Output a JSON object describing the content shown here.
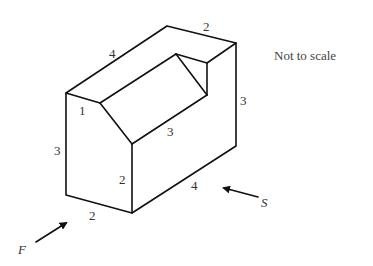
{
  "figure": {
    "note": "Not to scale",
    "dimensions": {
      "top_length": "4",
      "top_width": "2",
      "right_height": "3",
      "notch_slope": "1",
      "notch_length": "3",
      "left_height": "3",
      "front_step_height": "2",
      "bottom_length": "4",
      "bottom_width": "2"
    },
    "views": {
      "front": "F",
      "side": "S"
    }
  }
}
